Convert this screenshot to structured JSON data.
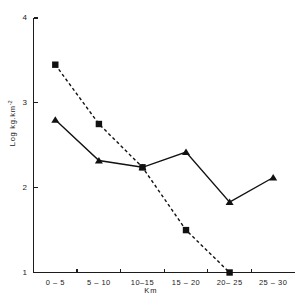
{
  "chart_data": {
    "type": "line",
    "title": "",
    "subtitle": "",
    "xlabel": "Km",
    "ylabel": "Log kg.km",
    "ylabel_exponent": "-2",
    "categories": [
      "0 – 5",
      "5 – 10",
      "10–15",
      "15 – 20",
      "20– 25",
      "25 – 30"
    ],
    "x_tick_labels": [
      "0 – 5",
      "5 – 10",
      "10–15",
      "15 – 20",
      "20– 25",
      "25 – 30"
    ],
    "y_tick_labels": [
      "4",
      "3",
      "2",
      "1"
    ],
    "y_ticks": [
      4,
      3,
      2,
      1
    ],
    "ylim": [
      1,
      4
    ],
    "grid": false,
    "legend": "none",
    "series": [
      {
        "name": "dashed-square-series",
        "marker": "square",
        "line_style": "dashed",
        "color": "#111111",
        "values": [
          3.45,
          2.75,
          2.24,
          1.5,
          1.0,
          null
        ]
      },
      {
        "name": "solid-triangle-series",
        "marker": "triangle",
        "line_style": "solid",
        "color": "#111111",
        "values": [
          2.8,
          2.32,
          2.24,
          2.42,
          1.83,
          2.12
        ]
      }
    ]
  },
  "axes": {
    "y_axis_name": "log-density-axis",
    "x_axis_name": "distance-axis"
  }
}
